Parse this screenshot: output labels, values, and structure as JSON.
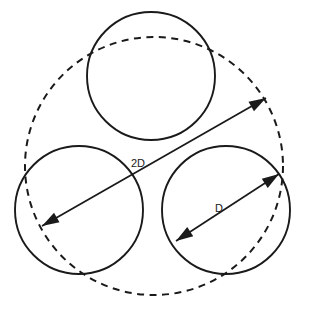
{
  "diagram": {
    "background_color": "#ffffff",
    "line_color": "#1a1a1a",
    "labels": {
      "outer_diameter": "2D",
      "inner_diameter": "D"
    },
    "shapes": {
      "enclosing_circle": {
        "name": "enclosing-dashed-circle",
        "style": "dashed",
        "cx": 154,
        "cy": 166,
        "r": 129
      },
      "circle_top": {
        "name": "inner-circle-top",
        "style": "solid",
        "cx": 151,
        "cy": 76,
        "r": 64
      },
      "circle_bottom_left": {
        "name": "inner-circle-bottom-left",
        "style": "solid",
        "cx": 79,
        "cy": 210,
        "r": 64
      },
      "circle_bottom_right": {
        "name": "inner-circle-bottom-right",
        "style": "solid",
        "cx": 226,
        "cy": 210,
        "r": 64
      }
    },
    "dimensions": {
      "outer": {
        "name": "dimension-2D",
        "label": "2D",
        "x1": 42,
        "y1": 226,
        "x2": 266,
        "y2": 98,
        "label_x": 145,
        "label_y": 167
      },
      "inner": {
        "name": "dimension-D",
        "label": "D",
        "x1": 176,
        "y1": 241,
        "x2": 279,
        "y2": 174,
        "label_x": 223,
        "label_y": 212
      }
    }
  }
}
